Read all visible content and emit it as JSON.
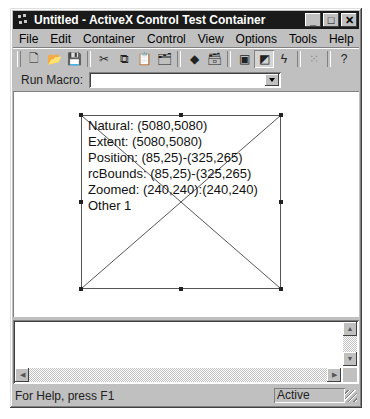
{
  "window": {
    "title": "Untitled - ActiveX Control Test Container",
    "buttons": {
      "minimize": "_",
      "maximize": "□",
      "close": "✕"
    }
  },
  "menubar": {
    "items": [
      {
        "label": "File",
        "mnemonic": "F"
      },
      {
        "label": "Edit",
        "mnemonic": "E"
      },
      {
        "label": "Container",
        "mnemonic": "C"
      },
      {
        "label": "Control",
        "mnemonic": "t"
      },
      {
        "label": "View",
        "mnemonic": "V"
      },
      {
        "label": "Options",
        "mnemonic": "O"
      },
      {
        "label": "Tools",
        "mnemonic": "T"
      },
      {
        "label": "Help",
        "mnemonic": "H"
      }
    ]
  },
  "toolbar": {
    "buttons": [
      {
        "name": "new-icon",
        "glyph": "🗋"
      },
      {
        "name": "open-icon",
        "glyph": "📂"
      },
      {
        "name": "save-icon",
        "glyph": "💾"
      },
      {
        "name": "cut-icon",
        "glyph": "✂"
      },
      {
        "name": "copy-icon",
        "glyph": "⧉"
      },
      {
        "name": "paste-icon",
        "glyph": "📋"
      },
      {
        "name": "insert-object-icon",
        "glyph": "🗂"
      },
      {
        "name": "invoke-methods-icon",
        "glyph": "◆"
      },
      {
        "name": "properties-icon",
        "glyph": "🗃"
      },
      {
        "name": "design-mode-icon",
        "glyph": "▣"
      },
      {
        "name": "run-mode-icon",
        "glyph": "◩"
      },
      {
        "name": "event-log-icon",
        "glyph": "ϟ"
      },
      {
        "name": "grid-icon",
        "glyph": "⁙"
      },
      {
        "name": "help-icon",
        "glyph": "?"
      }
    ]
  },
  "macrobar": {
    "label": "Run Macro:",
    "value": ""
  },
  "control": {
    "lines": [
      "Natural: (5080,5080)",
      "Extent: (5080,5080)",
      "Position: (85,25)-(325,265)",
      "rcBounds: (85,25)-(325,265)",
      "Zoomed: (240,240):(240,240)",
      "Other 1"
    ]
  },
  "output": {
    "text": ""
  },
  "statusbar": {
    "message": "For Help, press F1",
    "state": "Active"
  }
}
